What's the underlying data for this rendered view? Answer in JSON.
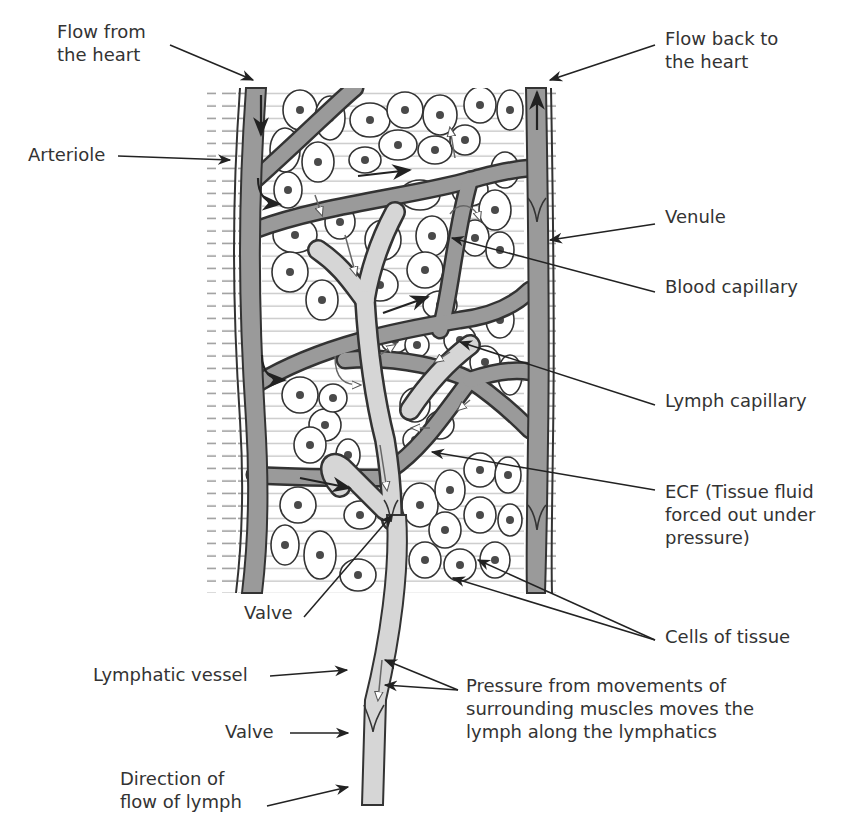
{
  "diagram": {
    "colors": {
      "blood_vessel": "#9a9a9a",
      "lymph_vessel": "#d6d6d6",
      "cell_fill": "#ffffff",
      "outline": "#333333",
      "nucleus": "#4a4a4a",
      "background_lines": "#888888",
      "label_text": "#333333"
    },
    "labels": {
      "flow_from_heart": "Flow from\nthe heart",
      "flow_back_to_heart": "Flow back to\nthe heart",
      "arteriole": "Arteriole",
      "venule": "Venule",
      "blood_capillary": "Blood capillary",
      "lymph_capillary": "Lymph capillary",
      "ecf": "ECF (Tissue fluid\nforced out under\npressure)",
      "cells_of_tissue": "Cells of tissue",
      "valve_upper": "Valve",
      "lymphatic_vessel": "Lymphatic vessel",
      "pressure_note": "Pressure from movements of\nsurrounding muscles moves the\nlymph along the lymphatics",
      "valve_lower": "Valve",
      "direction_of_flow": "Direction of\nflow of lymph"
    }
  }
}
